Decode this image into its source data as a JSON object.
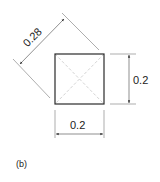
{
  "figure": {
    "panel_label": "(b)",
    "colors": {
      "outline": "#2a2a2a",
      "dim_line": "#555555",
      "diagonal": "#c8c8c8",
      "text": "#222222"
    }
  },
  "square": {
    "width_label": "0.2",
    "height_label": "0.2",
    "diagonal_label": "0.28"
  }
}
